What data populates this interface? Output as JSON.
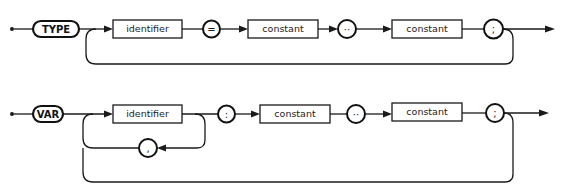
{
  "diagrams": [
    {
      "name": "type-declaration",
      "keyword": "TYPE",
      "identifier": "identifier",
      "equals": "=",
      "constant_low": "constant",
      "range": "··",
      "constant_high": "constant",
      "terminator": ";"
    },
    {
      "name": "var-declaration",
      "keyword": "VAR",
      "identifier": "identifier",
      "separator": ",",
      "colon": ":",
      "constant_low": "constant",
      "range": "··",
      "constant_high": "constant",
      "terminator": ";"
    }
  ]
}
